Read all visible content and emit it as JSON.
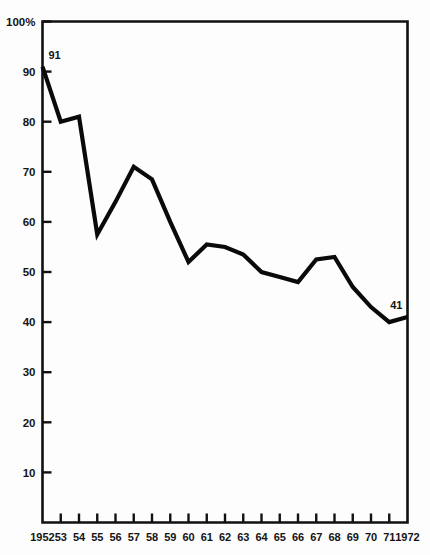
{
  "chart_data": {
    "type": "line",
    "title": "",
    "subtitle": "",
    "xlabel": "",
    "ylabel": "",
    "grid": false,
    "legend": "none",
    "xlim": [
      1952,
      1972
    ],
    "ylim": [
      0,
      100
    ],
    "y_tick_values": [
      10,
      20,
      30,
      40,
      50,
      60,
      70,
      80,
      90,
      100
    ],
    "y_tick_labels": [
      "10",
      "20",
      "30",
      "40",
      "50",
      "60",
      "70",
      "80",
      "90",
      "100%"
    ],
    "x": [
      1952,
      1953,
      1954,
      1955,
      1956,
      1957,
      1958,
      1959,
      1960,
      1961,
      1962,
      1963,
      1964,
      1965,
      1966,
      1967,
      1968,
      1969,
      1970,
      1971,
      1972
    ],
    "x_tick_labels": [
      "1952",
      "53",
      "54",
      "55",
      "56",
      "57",
      "58",
      "59",
      "60",
      "61",
      "62",
      "63",
      "64",
      "65",
      "66",
      "67",
      "68",
      "69",
      "70",
      "71",
      "1972"
    ],
    "values": [
      91,
      80,
      81,
      57.5,
      64,
      71,
      68.5,
      60,
      52,
      55.5,
      55,
      53.5,
      50,
      49,
      48,
      52.5,
      53,
      47,
      43,
      40,
      41
    ],
    "annotations": [
      {
        "name": "first-point-value",
        "text": "91",
        "x": 1952,
        "y": 91
      },
      {
        "name": "last-point-value",
        "text": "41",
        "x": 1972,
        "y": 41
      }
    ],
    "series": [
      {
        "name": "series-1",
        "color": "#0a0a0a",
        "values": [
          91,
          80,
          81,
          57.5,
          64,
          71,
          68.5,
          60,
          52,
          55.5,
          55,
          53.5,
          50,
          49,
          48,
          52.5,
          53,
          47,
          43,
          40,
          41
        ]
      }
    ]
  },
  "style": {
    "line_color": "#0a0a0a",
    "axis_color": "#111111",
    "text_color": "#141414",
    "background": "#fdfdfd"
  }
}
